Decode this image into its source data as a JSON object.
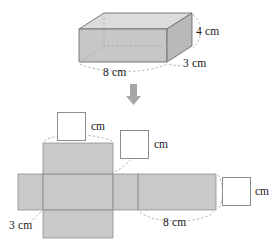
{
  "figure": {
    "colors": {
      "face_fill": "#c9c9c9",
      "face_fill_light": "#d6d6d6",
      "face_fill_top": "#d9d9d9",
      "outline": "#6e6e6e",
      "dashed": "#a8a8a8",
      "arrow": "#a0a0a0",
      "text": "#1a1a1a",
      "box_border": "#8c8c8c",
      "box_fill": "#ffffff"
    }
  },
  "prism": {
    "labels": {
      "height": "4 cm",
      "depth": "3 cm",
      "width": "8 cm"
    }
  },
  "arrow": {
    "direction": "down",
    "name": "transforms-into"
  },
  "net": {
    "known_labels": {
      "left_depth": "3 cm",
      "bottom_width": "8 cm"
    },
    "answer_boxes": [
      {
        "id": "top-width",
        "value": "",
        "unit": "cm"
      },
      {
        "id": "middle-depth",
        "value": "",
        "unit": "cm"
      },
      {
        "id": "right-height",
        "value": "",
        "unit": "cm"
      }
    ]
  }
}
